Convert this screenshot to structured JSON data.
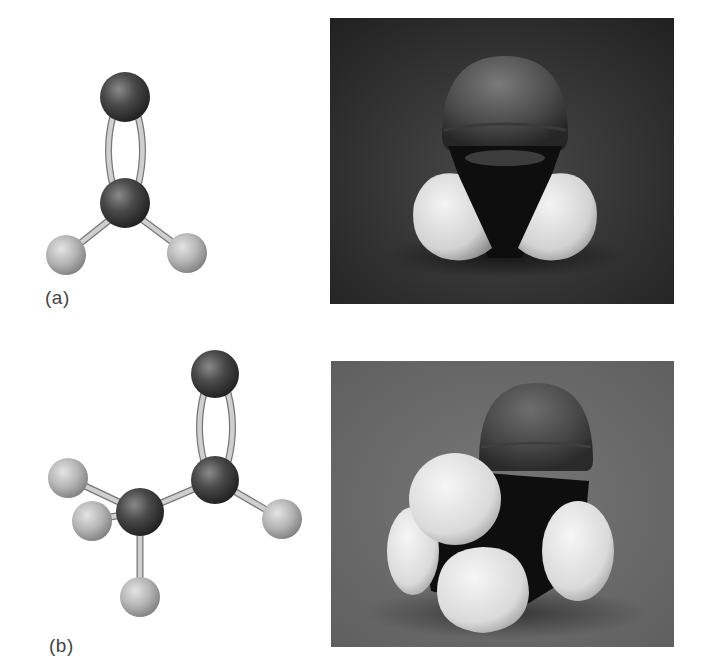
{
  "figure": {
    "panels": [
      {
        "label": "(a)",
        "molecule": "formaldehyde",
        "ball_and_stick": {
          "atoms": [
            {
              "element": "O",
              "x": 125,
              "y": 97,
              "r": 25
            },
            {
              "element": "C",
              "x": 125,
              "y": 203,
              "r": 25
            },
            {
              "element": "H",
              "x": 66,
              "y": 255,
              "r": 20
            },
            {
              "element": "H",
              "x": 187,
              "y": 253,
              "r": 20
            }
          ],
          "bonds": [
            {
              "from": 0,
              "to": 1,
              "order": 2
            },
            {
              "from": 1,
              "to": 2,
              "order": 1
            },
            {
              "from": 1,
              "to": 3,
              "order": 1
            }
          ]
        },
        "space_filling_photo": {
          "x": 330,
          "y": 18,
          "width": 344,
          "height": 286,
          "background": "#2e2e2e"
        }
      },
      {
        "label": "(b)",
        "molecule": "acetaldehyde",
        "ball_and_stick": {
          "atoms": [
            {
              "element": "O",
              "x": 215,
              "y": 374,
              "r": 24
            },
            {
              "element": "C",
              "x": 215,
              "y": 480,
              "r": 24
            },
            {
              "element": "C",
              "x": 140,
              "y": 512,
              "r": 24
            },
            {
              "element": "H",
              "x": 68,
              "y": 478,
              "r": 20
            },
            {
              "element": "H",
              "x": 92,
              "y": 521,
              "r": 20
            },
            {
              "element": "H",
              "x": 140,
              "y": 597,
              "r": 20
            },
            {
              "element": "H",
              "x": 282,
              "y": 519,
              "r": 20
            }
          ],
          "bonds": [
            {
              "from": 0,
              "to": 1,
              "order": 2
            },
            {
              "from": 1,
              "to": 2,
              "order": 1
            },
            {
              "from": 1,
              "to": 6,
              "order": 1
            },
            {
              "from": 2,
              "to": 3,
              "order": 1
            },
            {
              "from": 2,
              "to": 4,
              "order": 1
            },
            {
              "from": 2,
              "to": 5,
              "order": 1
            }
          ]
        },
        "space_filling_photo": {
          "x": 331,
          "y": 361,
          "width": 343,
          "height": 286,
          "background": "#6e6e6e"
        }
      }
    ],
    "colors": {
      "heavy_atom": "#3c3c3c",
      "hydrogen": "#b8b8b8",
      "bond": "#bdbdbd",
      "label_text": "#444444"
    }
  }
}
